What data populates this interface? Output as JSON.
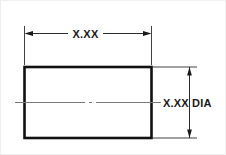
{
  "drawing": {
    "title": "Cylindrical part dimension callout",
    "background_color": "#ffffff",
    "border_color": "#efefef",
    "line_color": "#111111",
    "text_color": "#1a1a1a",
    "centerline_color": "#7a7a7a"
  },
  "dimensions": {
    "horizontal": {
      "label": "X.XX",
      "name": "length-dimension",
      "orientation": "horizontal",
      "position": "top"
    },
    "vertical": {
      "label": "X.XX DIA",
      "name": "diameter-dimension",
      "orientation": "vertical",
      "position": "right"
    }
  },
  "part": {
    "shape": "rectangle",
    "view": "side-view",
    "has_centerline": true
  }
}
